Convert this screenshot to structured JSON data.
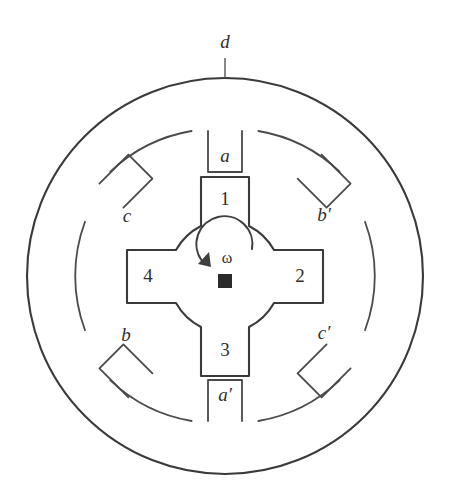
{
  "figure": {
    "type": "cross-section-diagram",
    "background_color": "#ffffff",
    "line_color": "#3a3a3a",
    "text_color": "#2f2f2f"
  },
  "geometry": {
    "center_x": 225,
    "center_y": 276,
    "outer_frame_radius": 198,
    "stator_yoke_inner_radius": 155,
    "stator_pole_inner_radius": 104,
    "rotor_pole_outer_radius": 99,
    "rotor_hub_radius": 60,
    "shaft_half_size": 7
  },
  "labels": {
    "outer_frame": {
      "text": "d",
      "x": 225,
      "y": 43,
      "leader_from_y": 57,
      "leader_to_y": 78
    },
    "stator_poles": [
      {
        "id": "a",
        "text": "a",
        "x": 225,
        "y": 157,
        "angle_deg": 90
      },
      {
        "id": "b-prime",
        "text": "b′",
        "x": 322,
        "y": 216,
        "angle_deg": 45
      },
      {
        "id": "c-prime",
        "text": "c′",
        "x": 322,
        "y": 334,
        "angle_deg": -45
      },
      {
        "id": "a-prime",
        "text": "a′",
        "x": 225,
        "y": 396,
        "angle_deg": -90
      },
      {
        "id": "b",
        "text": "b",
        "x": 126,
        "y": 336,
        "angle_deg": -135
      },
      {
        "id": "c",
        "text": "c",
        "x": 127,
        "y": 217,
        "angle_deg": 135
      }
    ],
    "rotor_poles": [
      {
        "id": "1",
        "text": "1",
        "x": 225,
        "y": 200,
        "angle_deg": 90
      },
      {
        "id": "2",
        "text": "2",
        "x": 300,
        "y": 277,
        "angle_deg": 0
      },
      {
        "id": "3",
        "text": "3",
        "x": 225,
        "y": 351,
        "angle_deg": -90
      },
      {
        "id": "4",
        "text": "4",
        "x": 148,
        "y": 277,
        "angle_deg": 180
      }
    ],
    "rotation": {
      "symbol": "ω",
      "x": 226,
      "y": 258,
      "direction": "counter-clockwise",
      "arrow_arc": "M 254 250 A 30 30 0 1 0 200 262",
      "arrow_head_points": "200,262 209,251 210,266"
    },
    "shaft": {
      "id": "shaft",
      "x": 225,
      "y": 281
    }
  },
  "shapes": {
    "outer_frame_circle": {
      "cx": 225,
      "cy": 276,
      "r": 198
    },
    "stator_bore_arcs": [
      "M 191.6 131.0 A 155 155 0 0 0 110.4 171.6",
      "M 85.0 221.8 A 155 155 0 0 0 85.0 330.2",
      "M 110.4 380.4 A 155 155 0 0 0 191.6 421.0",
      "M 258.4 421.0 A 155 155 0 0 0 339.6 380.4",
      "M 365.0 330.2 A 155 155 0 0 0 365.0 221.8",
      "M 339.6 171.6 A 155 155 0 0 0 258.4 131.0"
    ],
    "stator_poles": [
      {
        "id": "pole-a",
        "angle_deg": 90,
        "half_width": 17,
        "tip_radius": 104,
        "root_radius": 155
      },
      {
        "id": "pole-b-prime",
        "angle_deg": 45,
        "half_width": 17,
        "tip_radius": 104,
        "root_radius": 155
      },
      {
        "id": "pole-c-prime",
        "angle_deg": -45,
        "half_width": 17,
        "tip_radius": 104,
        "root_radius": 155
      },
      {
        "id": "pole-a-prime",
        "angle_deg": -90,
        "half_width": 17,
        "tip_radius": 104,
        "root_radius": 155
      },
      {
        "id": "pole-b",
        "angle_deg": -135,
        "half_width": 17,
        "tip_radius": 104,
        "root_radius": 155
      },
      {
        "id": "pole-c",
        "angle_deg": 135,
        "half_width": 17,
        "tip_radius": 104,
        "root_radius": 155
      }
    ],
    "rotor_outline": "M 201 177 L 201 226 A 60 60 0 0 0 176 250 L 127 250 L 127 303 L 176 303 A 60 60 0 0 0 201 327 L 201 376 L 249 376 L 249 327 A 60 60 0 0 0 274 303 L 323 303 L 323 250 L 274 250 A 60 60 0 0 0 249 226 L 249 177 Z"
  }
}
